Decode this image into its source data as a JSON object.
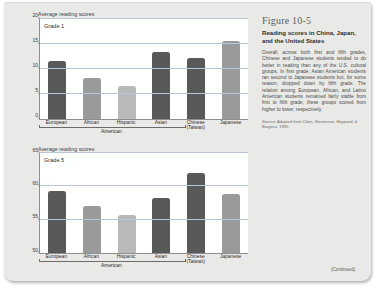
{
  "caption": {
    "figure_number": "Figure 10-5",
    "title": "Reading scores in China, Japan, and the United States",
    "body": "Overall, across both first and fifth grades, Chinese and Japanese students tended to do better in reading than any of the U.S. cultural groups. In first grade, Asian American students ran second to Japanese students but, for some reason, dropped down by fifth grade. The relation among European, African, and Latino American students remained fairly stable from first to fifth grade; these groups scored from higher to lower, respectively.",
    "source": "Source: Adapted from Chen, Stevenson, Hayward, & Burgess, 1995."
  },
  "footer": {
    "continued": "(Continued)"
  },
  "colors": {
    "dark_bar": "#595959",
    "medium_bar": "#9a9a9a",
    "light_bar": "#b9b9b9",
    "gridline": "#b9c6d8",
    "axis": "#8e8e8e",
    "page_background": "#e9e9e7"
  },
  "chart_data": [
    {
      "type": "bar",
      "title": "Grade 1",
      "ylabel": "Average reading scores",
      "xlabel": "American",
      "categories": [
        "European",
        "African",
        "Hispanic",
        "Asian",
        "Chinese (Taiwan)",
        "Japanese"
      ],
      "category_lines": [
        [
          "European"
        ],
        [
          "African"
        ],
        [
          "Hispanic"
        ],
        [
          "Asian"
        ],
        [
          "Chinese",
          "(Taiwan)"
        ],
        [
          "Japanese"
        ]
      ],
      "values": [
        11.5,
        8.1,
        6.6,
        13.3,
        12.1,
        15.5
      ],
      "bar_colors": [
        "#595959",
        "#9a9a9a",
        "#b9b9b9",
        "#595959",
        "#595959",
        "#9a9a9a"
      ],
      "ylim": [
        0,
        20
      ],
      "yticks": [
        0,
        5,
        10,
        15,
        20
      ],
      "ytick_labels": [
        "0",
        "5",
        "10",
        "15",
        "20"
      ],
      "grid": true,
      "bracket_label": "American",
      "bracket_span": 4
    },
    {
      "type": "bar",
      "title": "Grade 5",
      "ylabel": "Average reading scores",
      "xlabel": "American",
      "categories": [
        "European",
        "African",
        "Hispanic",
        "Asian",
        "Chinese (Taiwan)",
        "Japanese"
      ],
      "category_lines": [
        [
          "European"
        ],
        [
          "African"
        ],
        [
          "Hispanic"
        ],
        [
          "Asian"
        ],
        [
          "Chinese",
          "(Taiwan)"
        ],
        [
          "Japanese"
        ]
      ],
      "values": [
        59.3,
        57.0,
        55.7,
        58.3,
        62.0,
        58.8
      ],
      "bar_colors": [
        "#595959",
        "#9a9a9a",
        "#b9b9b9",
        "#595959",
        "#595959",
        "#9a9a9a"
      ],
      "ylim": [
        50,
        65
      ],
      "yticks": [
        50,
        55,
        60,
        65
      ],
      "ytick_labels": [
        "50",
        "55",
        "60",
        "65"
      ],
      "grid": true,
      "bracket_label": "American",
      "bracket_span": 4
    }
  ]
}
